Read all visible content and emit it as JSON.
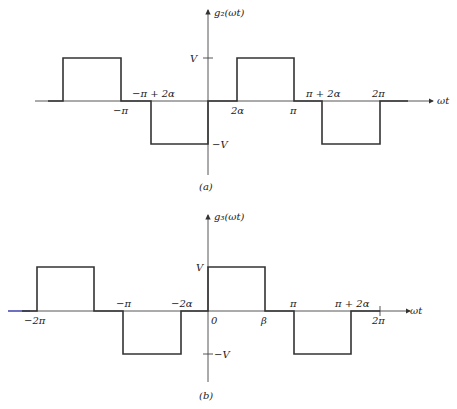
{
  "figure_a": {
    "caption": "(a)",
    "y_axis_label": "g₂(ωt)",
    "x_axis_label": "ωt",
    "y_ticks": {
      "pos": "V",
      "neg": "−V"
    },
    "x_labels": {
      "neg_pi": "−π",
      "neg_pi_plus_2alpha": "−π + 2α",
      "two_alpha": "2α",
      "pi": "π",
      "pi_plus_2alpha": "π + 2α",
      "two_pi": "2π"
    }
  },
  "figure_b": {
    "caption": "(b)",
    "y_axis_label": "g₃(ωt)",
    "x_axis_label": "ωt",
    "y_ticks": {
      "pos": "V",
      "neg": "−V"
    },
    "x_labels": {
      "neg_two_pi": "−2π",
      "neg_pi": "−π",
      "neg_two_alpha": "−2α",
      "zero": "0",
      "beta": "β",
      "pi": "π",
      "pi_plus_2alpha": "π + 2α",
      "two_pi": "2π"
    }
  }
}
